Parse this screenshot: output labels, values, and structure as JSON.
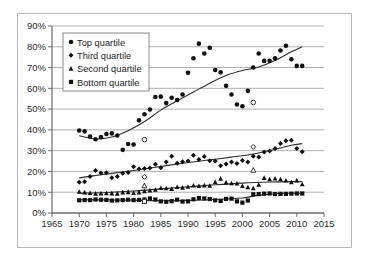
{
  "chart_data": {
    "type": "scatter",
    "title": "",
    "xlabel": "",
    "ylabel": "",
    "xlim": [
      1965,
      2015
    ],
    "ylim": [
      0,
      90
    ],
    "xticks": [
      1965,
      1970,
      1975,
      1980,
      1985,
      1990,
      1995,
      2000,
      2005,
      2010,
      2015
    ],
    "yticks": [
      0,
      10,
      20,
      30,
      40,
      50,
      60,
      70,
      80,
      90
    ],
    "ytick_labels": [
      "0%",
      "10%",
      "20%",
      "30%",
      "40%",
      "50%",
      "60%",
      "70%",
      "80%",
      "90%"
    ],
    "xtick_labels": [
      "1965",
      "1970",
      "1975",
      "1980",
      "1985",
      "1990",
      "1995",
      "2000",
      "2005",
      "2010",
      "2015"
    ],
    "grid": "horizontal",
    "legend_position": "top-left",
    "series": [
      {
        "name": "Top quartile",
        "marker": "circle",
        "color": "#111111",
        "x": [
          1970,
          1971,
          1972,
          1973,
          1974,
          1975,
          1976,
          1977,
          1978,
          1979,
          1980,
          1981,
          1982,
          1983,
          1984,
          1985,
          1986,
          1987,
          1988,
          1989,
          1990,
          1991,
          1992,
          1993,
          1994,
          1995,
          1996,
          1997,
          1998,
          1999,
          2000,
          2001,
          2002,
          2003,
          2004,
          2005,
          2006,
          2007,
          2008,
          2009,
          2010,
          2011
        ],
        "values": [
          39.7,
          39.3,
          36.8,
          35.5,
          36.5,
          38.0,
          38.3,
          37.3,
          30.4,
          33.2,
          33.0,
          44.6,
          47.5,
          49.8,
          55.8,
          56.0,
          52.9,
          55.5,
          54.4,
          57.0,
          67.5,
          74.5,
          81.5,
          76.8,
          79.5,
          68.8,
          67.7,
          61.2,
          57.0,
          52.2,
          51.4,
          58.8,
          70.0,
          76.8,
          73.2,
          73.3,
          74.5,
          78.2,
          80.5,
          74.0,
          70.8,
          70.8
        ],
        "open_markers": [
          {
            "x": 1982,
            "y": 35.3
          },
          {
            "x": 2002,
            "y": 53.2
          }
        ],
        "trend": "rising S-curve from ~37% (1970) through ~50% (1985) to ~80% (2011)"
      },
      {
        "name": "Third quartile",
        "marker": "diamond",
        "color": "#111111",
        "x": [
          1970,
          1971,
          1972,
          1973,
          1974,
          1975,
          1976,
          1977,
          1978,
          1979,
          1980,
          1981,
          1982,
          1983,
          1984,
          1985,
          1986,
          1987,
          1988,
          1989,
          1990,
          1991,
          1992,
          1993,
          1994,
          1995,
          1996,
          1997,
          1998,
          1999,
          2000,
          2001,
          2002,
          2003,
          2004,
          2005,
          2006,
          2007,
          2008,
          2009,
          2010,
          2011
        ],
        "values": [
          14.8,
          15.0,
          17.6,
          20.4,
          19.2,
          19.4,
          17.0,
          17.6,
          19.1,
          19.5,
          22.2,
          21.2,
          21.4,
          21.6,
          23.5,
          21.8,
          24.5,
          27.3,
          24.0,
          24.7,
          25.0,
          27.8,
          25.8,
          27.2,
          25.2,
          25.0,
          22.8,
          23.6,
          24.5,
          23.8,
          25.3,
          24.6,
          27.3,
          27.0,
          29.3,
          29.8,
          31.0,
          33.4,
          34.8,
          35.0,
          31.0,
          29.5
        ],
        "open_markers": [
          {
            "x": 1982,
            "y": 17.4
          },
          {
            "x": 2002,
            "y": 31.8
          }
        ],
        "trend": "steady rise from ~17% (1970) to ~33% (2011)"
      },
      {
        "name": "Second quartile",
        "marker": "triangle",
        "color": "#111111",
        "x": [
          1970,
          1971,
          1972,
          1973,
          1974,
          1975,
          1976,
          1977,
          1978,
          1979,
          1980,
          1981,
          1982,
          1983,
          1984,
          1985,
          1986,
          1987,
          1988,
          1989,
          1990,
          1991,
          1992,
          1993,
          1994,
          1995,
          1996,
          1997,
          1998,
          1999,
          2000,
          2001,
          2002,
          2003,
          2004,
          2005,
          2006,
          2007,
          2008,
          2009,
          2010,
          2011
        ],
        "values": [
          10.2,
          9.9,
          9.6,
          9.3,
          9.4,
          9.5,
          9.4,
          9.3,
          9.9,
          10.0,
          9.6,
          9.9,
          10.5,
          10.8,
          11.2,
          12.0,
          11.9,
          11.6,
          12.5,
          12.2,
          12.6,
          13.2,
          13.0,
          13.3,
          13.1,
          14.9,
          16.5,
          14.7,
          14.3,
          14.2,
          13.0,
          12.4,
          11.9,
          13.6,
          16.9,
          16.2,
          16.6,
          16.2,
          15.6,
          14.8,
          15.7,
          13.8
        ],
        "open_markers": [
          {
            "x": 1982,
            "y": 13.1
          },
          {
            "x": 2002,
            "y": 20.6
          }
        ],
        "trend": "gentle rise from ~10% (1970) to ~15% (2011)"
      },
      {
        "name": "Bottom quartile",
        "marker": "square",
        "color": "#111111",
        "x": [
          1970,
          1971,
          1972,
          1973,
          1974,
          1975,
          1976,
          1977,
          1978,
          1979,
          1980,
          1981,
          1982,
          1983,
          1984,
          1985,
          1986,
          1987,
          1988,
          1989,
          1990,
          1991,
          1992,
          1993,
          1994,
          1995,
          1996,
          1997,
          1998,
          1999,
          2000,
          2001,
          2002,
          2003,
          2004,
          2005,
          2006,
          2007,
          2008,
          2009,
          2010,
          2011
        ],
        "values": [
          6.1,
          6.2,
          6.2,
          6.5,
          6.4,
          6.3,
          6.0,
          6.1,
          6.2,
          6.4,
          6.2,
          6.3,
          6.5,
          7.0,
          6.5,
          5.6,
          5.4,
          5.7,
          6.4,
          5.5,
          5.6,
          6.6,
          7.2,
          7.0,
          6.7,
          6.1,
          5.8,
          6.8,
          6.9,
          5.6,
          5.0,
          6.0,
          9.0,
          9.1,
          9.3,
          9.4,
          9.1,
          9.2,
          9.2,
          9.3,
          9.4,
          9.4
        ],
        "open_markers": [
          {
            "x": 1982,
            "y": 5.6
          }
        ],
        "trend": "flat near 6% until ~2001, stepping to ~9.4%"
      }
    ],
    "trendlines": [
      {
        "series": "Top quartile",
        "points": [
          [
            1970,
            37.2
          ],
          [
            1973,
            35.6
          ],
          [
            1976,
            36.6
          ],
          [
            1979,
            39.6
          ],
          [
            1982,
            44.0
          ],
          [
            1985,
            49.5
          ],
          [
            1988,
            54.0
          ],
          [
            1991,
            58.2
          ],
          [
            1994,
            62.5
          ],
          [
            1997,
            66.2
          ],
          [
            2000,
            68.6
          ],
          [
            2003,
            70.3
          ],
          [
            2006,
            73.4
          ],
          [
            2009,
            77.6
          ],
          [
            2011,
            80.0
          ]
        ]
      },
      {
        "series": "Third quartile",
        "points": [
          [
            1970,
            16.9
          ],
          [
            1974,
            18.4
          ],
          [
            1978,
            19.7
          ],
          [
            1982,
            21.2
          ],
          [
            1986,
            22.8
          ],
          [
            1990,
            24.3
          ],
          [
            1994,
            25.6
          ],
          [
            1998,
            26.9
          ],
          [
            2002,
            28.4
          ],
          [
            2006,
            30.7
          ],
          [
            2009,
            32.6
          ],
          [
            2011,
            33.4
          ]
        ]
      },
      {
        "series": "Second quartile",
        "points": [
          [
            1970,
            9.5
          ],
          [
            1975,
            9.9
          ],
          [
            1980,
            10.6
          ],
          [
            1985,
            11.6
          ],
          [
            1990,
            12.6
          ],
          [
            1995,
            13.6
          ],
          [
            2000,
            14.4
          ],
          [
            2005,
            14.9
          ],
          [
            2009,
            15.1
          ],
          [
            2011,
            15.1
          ]
        ]
      },
      {
        "series": "Bottom quartile",
        "points": [
          [
            1970,
            6.4
          ],
          [
            1975,
            6.3
          ],
          [
            1980,
            6.2
          ],
          [
            1985,
            5.9
          ],
          [
            1990,
            6.1
          ],
          [
            1995,
            6.5
          ],
          [
            2000,
            7.2
          ],
          [
            2003,
            8.6
          ],
          [
            2006,
            9.3
          ],
          [
            2009,
            9.5
          ],
          [
            2011,
            9.5
          ]
        ]
      }
    ]
  },
  "legend": {
    "items": [
      {
        "label": "Top quartile",
        "marker": "circle"
      },
      {
        "label": "Third quartile",
        "marker": "diamond"
      },
      {
        "label": "Second quartile",
        "marker": "triangle"
      },
      {
        "label": "Bottom quartile",
        "marker": "square"
      }
    ]
  },
  "colors": {
    "marker": "#111111",
    "trendline": "#2b2b2b",
    "gridline": "#8c8c8c",
    "axis": "#4d4d4d",
    "frame": "#b8b8b8",
    "background": "#ffffff"
  }
}
